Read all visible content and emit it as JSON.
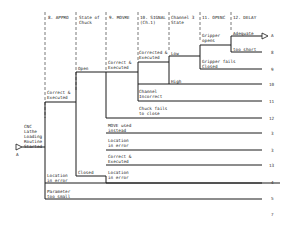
{
  "headers": [
    {
      "label": "8. APPRO",
      "x": 48
    },
    {
      "label": "State of\nChuck",
      "x": 79
    },
    {
      "label": "9. MOVRE",
      "x": 109
    },
    {
      "label": "10. SIGNAL\n(Ch.1)",
      "x": 140
    },
    {
      "label": "Channel 3\nState",
      "x": 171
    },
    {
      "label": "11. OPENC",
      "x": 202
    },
    {
      "label": "12. DELAY",
      "x": 233
    }
  ],
  "start": {
    "label": "CNC\nLathe\nLoading\nRoutine\nStarted",
    "marker": "A"
  },
  "branches": [
    {
      "id": "approx-ok",
      "label": "Correct &\nExecuted"
    },
    {
      "id": "open",
      "label": "Open"
    },
    {
      "id": "closed",
      "label": "Closed"
    },
    {
      "id": "movre-ok",
      "label": "Correct &\nExecuted"
    },
    {
      "id": "signal-ok",
      "label": "Corrected &\nExecuted"
    },
    {
      "id": "low",
      "label": "Low"
    },
    {
      "id": "high",
      "label": "High"
    },
    {
      "id": "gripper-opens",
      "label": "Gripper\nopens"
    },
    {
      "id": "adequate",
      "label": "Adequate"
    },
    {
      "id": "too-short",
      "label": "too short"
    },
    {
      "id": "gripper-fails",
      "label": "Gripper fails\nClosed"
    },
    {
      "id": "channel-incorrect",
      "label": "Channel\nIncorrect"
    },
    {
      "id": "chuck-fails",
      "label": "Chuck fails\nto close"
    },
    {
      "id": "move-used",
      "label": "MOVE used\ninstead"
    },
    {
      "id": "location-err-1",
      "label": "Location\nin error"
    },
    {
      "id": "closed-ok",
      "label": "Correct &\nExecuted"
    },
    {
      "id": "location-err-2",
      "label": "Location\nin error"
    },
    {
      "id": "location-err-3",
      "label": "Location\nin error"
    },
    {
      "id": "param-small",
      "label": "Parameter\ntoo small"
    }
  ],
  "outcomes": [
    "A",
    "8",
    "9",
    "10",
    "11",
    "12",
    "3",
    "3",
    "13",
    "4",
    "5",
    "7"
  ],
  "colors": {
    "line": "#1a1a1a",
    "dash": "#555555",
    "text": "#222222"
  }
}
